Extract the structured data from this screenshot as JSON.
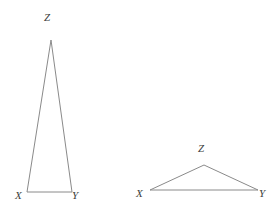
{
  "figure": {
    "background_color": "#ffffff",
    "stroke_color": "#8a8a8a",
    "label_color": "#3d3d3d",
    "canvas": {
      "width": 279,
      "height": 215
    },
    "shapes": [
      {
        "id": "triangle-left",
        "name": "tall-narrow-triangle",
        "points": "27,192 72,192 51,40",
        "vertices": [
          {
            "label": "X",
            "x": 27,
            "y": 192
          },
          {
            "label": "Y",
            "x": 72,
            "y": 192
          },
          {
            "label": "Z",
            "x": 51,
            "y": 40
          }
        ],
        "labels": {
          "x": "X",
          "y": "Y",
          "z": "Z"
        }
      },
      {
        "id": "triangle-right",
        "name": "short-wide-triangle",
        "points": "150,190 258,190 204,165",
        "vertices": [
          {
            "label": "X",
            "x": 150,
            "y": 190
          },
          {
            "label": "Y",
            "x": 258,
            "y": 190
          },
          {
            "label": "Z",
            "x": 204,
            "y": 165
          }
        ],
        "labels": {
          "x": "X",
          "y": "Y",
          "z": "Z"
        }
      }
    ]
  }
}
